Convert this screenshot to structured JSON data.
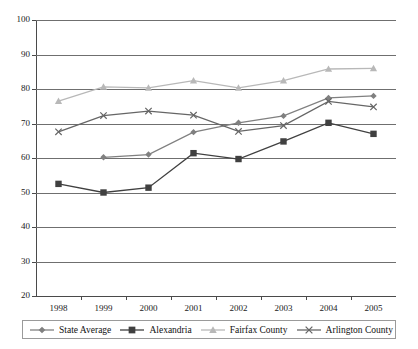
{
  "chart_data": {
    "type": "line",
    "title": "",
    "subtitle": "",
    "xlabel": "",
    "ylabel": "",
    "categories": [
      "1998",
      "1999",
      "2000",
      "2001",
      "2002",
      "2003",
      "2004",
      "2005"
    ],
    "ylim": [
      20,
      100
    ],
    "yticks": [
      20,
      30,
      40,
      50,
      60,
      70,
      80,
      90,
      100
    ],
    "grid": true,
    "legend_position": "bottom",
    "series": [
      {
        "name": "State Average",
        "marker": "diamond",
        "color": "#808080",
        "values": [
          null,
          60.2,
          61.0,
          67.5,
          70.2,
          72.2,
          77.4,
          78.0
        ]
      },
      {
        "name": "Alexandria",
        "marker": "square",
        "color": "#404040",
        "values": [
          52.5,
          50.0,
          51.4,
          61.4,
          59.7,
          64.8,
          70.2,
          67.0
        ]
      },
      {
        "name": "Fairfax County",
        "marker": "triangle",
        "color": "#b8b8b8",
        "values": [
          76.5,
          80.6,
          80.3,
          82.4,
          80.3,
          82.4,
          85.8,
          86.0
        ]
      },
      {
        "name": "Arlington County",
        "marker": "x",
        "color": "#666666",
        "values": [
          67.6,
          72.3,
          73.6,
          72.4,
          67.7,
          69.4,
          76.4,
          74.8
        ]
      }
    ]
  },
  "legend": {
    "items": [
      {
        "label": "State Average"
      },
      {
        "label": "Alexandria"
      },
      {
        "label": "Fairfax County"
      },
      {
        "label": "Arlington County"
      }
    ]
  },
  "caption": {
    "text": ""
  }
}
